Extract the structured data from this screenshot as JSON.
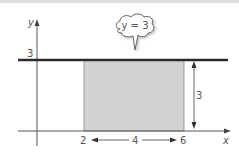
{
  "diagram": {
    "type": "coordinate-graph",
    "axes": {
      "x_label": "x",
      "y_label": "y"
    },
    "line": {
      "equation_label": "y = 3",
      "y_tick_label": "3"
    },
    "region": {
      "x_start_label": "2",
      "x_end_label": "6",
      "width_label": "4",
      "height_label": "3",
      "fill_color": "#cfcfcf"
    },
    "colors": {
      "line": "#2b2b2b",
      "axis": "#555555",
      "text": "#555555"
    }
  }
}
